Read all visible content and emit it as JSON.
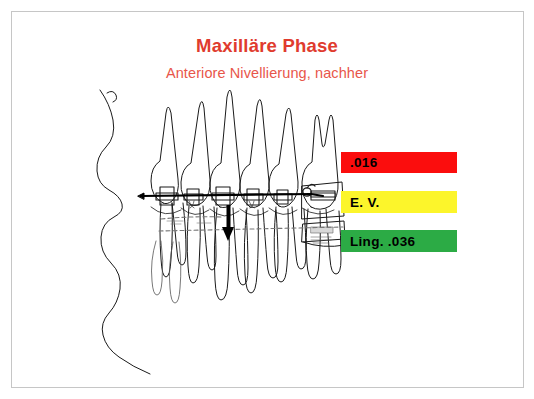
{
  "slide": {
    "title": "Maxilläre Phase",
    "subtitle": "Anteriore Nivellierung, nachher",
    "title_color": "#e03b2e",
    "subtitle_color": "#e8564a",
    "background": "#ffffff",
    "border_color": "#c6c6c6"
  },
  "legend": {
    "items": [
      {
        "label": ".016",
        "color": "#fb0d0d",
        "text_color": "#000000",
        "name": "wire-016"
      },
      {
        "label": "E. V.",
        "color": "#fcf52b",
        "text_color": "#000000",
        "name": "elastic-chain"
      },
      {
        "label": "Ling. .036",
        "color": "#2cab45",
        "text_color": "#000000",
        "name": "lingual-arch-036"
      }
    ]
  },
  "illustration": {
    "type": "orthodontic-dental-line-drawing",
    "description": "Lateral line drawing of maxillary anterior and posterior teeth with bonded brackets, a continuous archwire, a vertical force arrow at the central incisor region, a dashed lingual arch wire, and a banded molar with buccal tube at the distal end. A wavy palatal/soft-tissue profile contour runs down the left side.",
    "stroke_color": "#1a1a1a",
    "arrow_color": "#000000"
  }
}
